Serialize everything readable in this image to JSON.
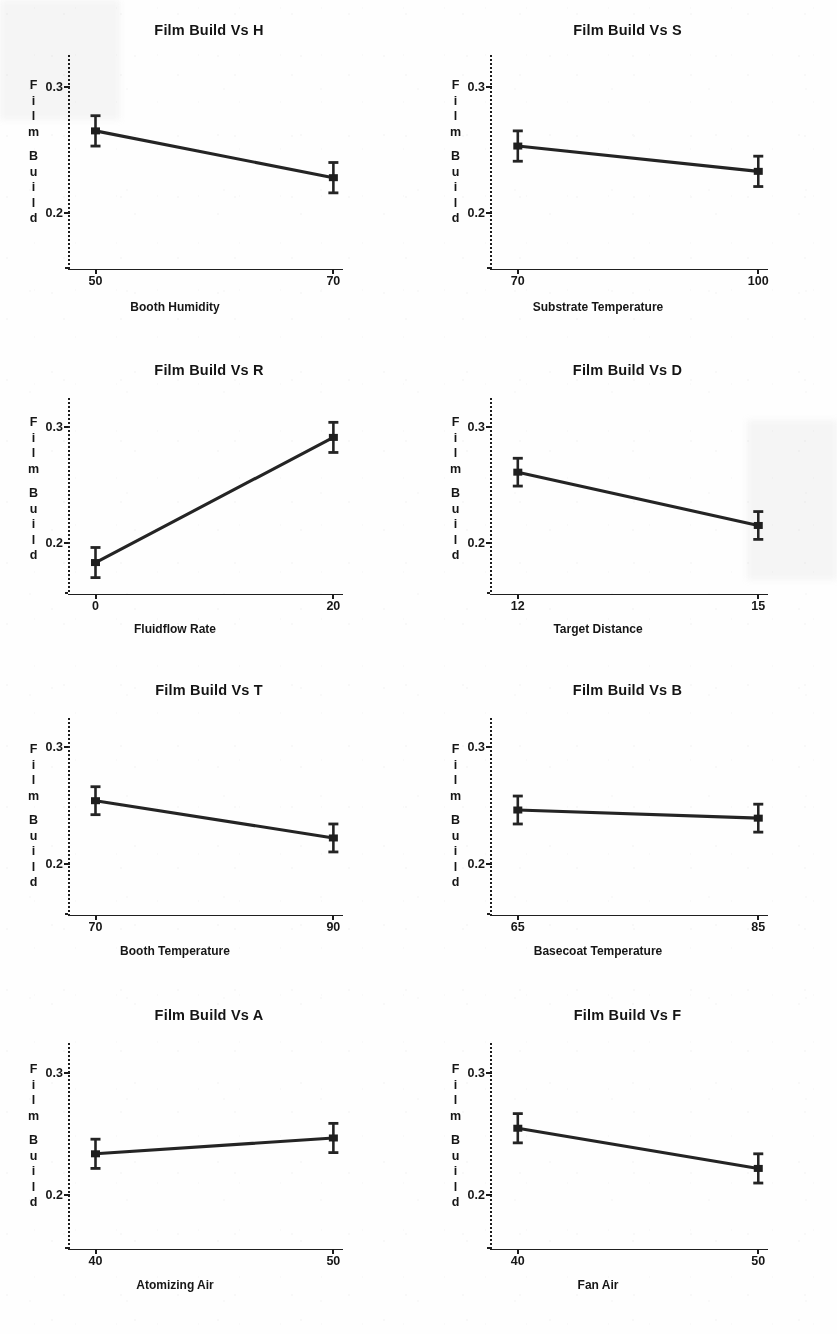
{
  "document": {
    "kind": "main-effects-plot-sheet",
    "response_name": "Film Build",
    "y_axis_label_lines": [
      "Film",
      "Build"
    ],
    "panel_count": 8,
    "columns": 2,
    "rows": 4
  },
  "chart_data": [
    {
      "type": "line",
      "id": "H",
      "title": "Film Build Vs H",
      "xlabel": "Booth Humidity",
      "ylabel": "Film Build",
      "x": [
        50,
        70
      ],
      "xtick_labels": [
        "50",
        "70"
      ],
      "values": [
        0.265,
        0.228
      ],
      "errors": [
        0.012,
        0.012
      ],
      "ytick_labels": [
        "0.3",
        "0.2"
      ],
      "ytick_values": [
        0.3,
        0.2
      ],
      "ylim": [
        0.155,
        0.325
      ],
      "grid": false,
      "legend": "none"
    },
    {
      "type": "line",
      "id": "S",
      "title": "Film Build Vs S",
      "xlabel": "Substrate Temperature",
      "ylabel": "Film Build",
      "x": [
        70,
        100
      ],
      "xtick_labels": [
        "70",
        "100"
      ],
      "values": [
        0.253,
        0.233
      ],
      "errors": [
        0.012,
        0.012
      ],
      "ytick_labels": [
        "0.3",
        "0.2"
      ],
      "ytick_values": [
        0.3,
        0.2
      ],
      "ylim": [
        0.155,
        0.325
      ],
      "grid": false,
      "legend": "none"
    },
    {
      "type": "line",
      "id": "R",
      "title": "Film Build Vs R",
      "xlabel": "Fluidflow Rate",
      "ylabel": "Film Build",
      "x": [
        0,
        20
      ],
      "xtick_labels": [
        "0",
        "20"
      ],
      "values": [
        0.183,
        0.291
      ],
      "errors": [
        0.013,
        0.013
      ],
      "ytick_labels": [
        "0.3",
        "0.2"
      ],
      "ytick_values": [
        0.3,
        0.2
      ],
      "ylim": [
        0.155,
        0.325
      ],
      "grid": false,
      "legend": "none"
    },
    {
      "type": "line",
      "id": "D",
      "title": "Film Build Vs D",
      "xlabel": "Target Distance",
      "ylabel": "Film Build",
      "x": [
        12,
        15
      ],
      "xtick_labels": [
        "12",
        "15"
      ],
      "values": [
        0.261,
        0.215
      ],
      "errors": [
        0.012,
        0.012
      ],
      "ytick_labels": [
        "0.3",
        "0.2"
      ],
      "ytick_values": [
        0.3,
        0.2
      ],
      "ylim": [
        0.155,
        0.325
      ],
      "grid": false,
      "legend": "none"
    },
    {
      "type": "line",
      "id": "T",
      "title": "Film Build Vs T",
      "xlabel": "Booth Temperature",
      "ylabel": "Film Build",
      "x": [
        70,
        90
      ],
      "xtick_labels": [
        "70",
        "90"
      ],
      "values": [
        0.254,
        0.222
      ],
      "errors": [
        0.012,
        0.012
      ],
      "ytick_labels": [
        "0.3",
        "0.2"
      ],
      "ytick_values": [
        0.3,
        0.2
      ],
      "ylim": [
        0.155,
        0.325
      ],
      "grid": false,
      "legend": "none"
    },
    {
      "type": "line",
      "id": "B",
      "title": "Film Build Vs B",
      "xlabel": "Basecoat Temperature",
      "ylabel": "Film Build",
      "x": [
        65,
        85
      ],
      "xtick_labels": [
        "65",
        "85"
      ],
      "values": [
        0.246,
        0.239
      ],
      "errors": [
        0.012,
        0.012
      ],
      "ytick_labels": [
        "0.3",
        "0.2"
      ],
      "ytick_values": [
        0.3,
        0.2
      ],
      "ylim": [
        0.155,
        0.325
      ],
      "grid": false,
      "legend": "none"
    },
    {
      "type": "line",
      "id": "A",
      "title": "Film Build Vs A",
      "xlabel": "Atomizing Air",
      "ylabel": "Film Build",
      "x": [
        40,
        50
      ],
      "xtick_labels": [
        "40",
        "50"
      ],
      "values": [
        0.234,
        0.247
      ],
      "errors": [
        0.012,
        0.012
      ],
      "ytick_labels": [
        "0.3",
        "0.2"
      ],
      "ytick_values": [
        0.3,
        0.2
      ],
      "ylim": [
        0.155,
        0.325
      ],
      "grid": false,
      "legend": "none"
    },
    {
      "type": "line",
      "id": "F",
      "title": "Film Build Vs F",
      "xlabel": "Fan Air",
      "ylabel": "Film Build",
      "x": [
        40,
        50
      ],
      "xtick_labels": [
        "40",
        "50"
      ],
      "values": [
        0.255,
        0.222
      ],
      "errors": [
        0.012,
        0.012
      ],
      "ytick_labels": [
        "0.3",
        "0.2"
      ],
      "ytick_values": [
        0.3,
        0.2
      ],
      "ylim": [
        0.155,
        0.325
      ],
      "grid": false,
      "legend": "none"
    }
  ],
  "style": {
    "ink_color": "#1f1f1f",
    "paper_color": "#fefefe"
  }
}
